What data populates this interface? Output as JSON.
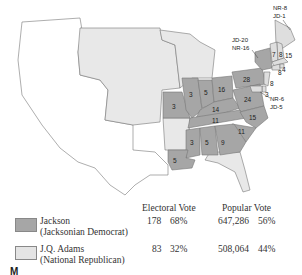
{
  "map": {
    "colors": {
      "jackson": "#a6a6a6",
      "adams": "#dedede",
      "territory": "#e8e8e8",
      "unorganized": "#ffffff",
      "border": "#777777"
    },
    "states": [
      {
        "name": "Missouri",
        "votes": "3",
        "winner": "jackson"
      },
      {
        "name": "Illinois",
        "votes": "3",
        "winner": "jackson"
      },
      {
        "name": "Indiana",
        "votes": "5",
        "winner": "jackson"
      },
      {
        "name": "Ohio",
        "votes": "16",
        "winner": "jackson"
      },
      {
        "name": "Pennsylvania",
        "votes": "28",
        "winner": "jackson"
      },
      {
        "name": "Kentucky",
        "votes": "14",
        "winner": "jackson"
      },
      {
        "name": "Virginia",
        "votes": "24",
        "winner": "jackson"
      },
      {
        "name": "Tennessee",
        "votes": "11",
        "winner": "jackson"
      },
      {
        "name": "North Carolina",
        "votes": "15",
        "winner": "jackson"
      },
      {
        "name": "South Carolina",
        "votes": "11",
        "winner": "jackson"
      },
      {
        "name": "Mississippi",
        "votes": "3",
        "winner": "jackson"
      },
      {
        "name": "Alabama",
        "votes": "5",
        "winner": "jackson"
      },
      {
        "name": "Georgia",
        "votes": "9",
        "winner": "jackson"
      },
      {
        "name": "Louisiana",
        "votes": "5",
        "winner": "jackson"
      },
      {
        "name": "Vermont",
        "votes": "7",
        "winner": "adams"
      },
      {
        "name": "New Hampshire",
        "votes": "8",
        "winner": "adams"
      },
      {
        "name": "Massachusetts",
        "votes": "15",
        "winner": "adams"
      },
      {
        "name": "Rhode Island",
        "votes": "4",
        "winner": "adams"
      },
      {
        "name": "Connecticut",
        "votes": "8",
        "winner": "adams"
      },
      {
        "name": "New Jersey",
        "votes": "8",
        "winner": "adams"
      },
      {
        "name": "Delaware",
        "votes": "3",
        "winner": "adams"
      }
    ],
    "split_labels": {
      "maine_1": "NR-8",
      "maine_2": "JD-1",
      "ny_1": "JD-20",
      "ny_2": "NR-16",
      "md_1": "NR-6",
      "md_2": "JD-5"
    }
  },
  "legend": {
    "headers": {
      "electoral": "Electoral Vote",
      "popular": "Popular Vote"
    },
    "rows": [
      {
        "name": "Jackson",
        "party": "(Jacksonian Democrat)",
        "ev": "178",
        "ev_pct": "68%",
        "pv": "647,286",
        "pv_pct": "56%",
        "color": "#a6a6a6"
      },
      {
        "name": "J.Q. Adams",
        "party": "(National Republican)",
        "ev": "83",
        "ev_pct": "32%",
        "pv": "508,064",
        "pv_pct": "44%",
        "color": "#e4e4e4"
      }
    ]
  },
  "caption": "M"
}
